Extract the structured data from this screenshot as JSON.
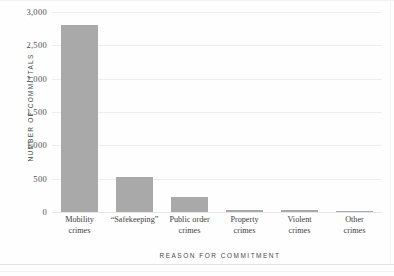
{
  "chart_data": {
    "type": "bar",
    "title": "",
    "subtitle": "",
    "xlabel": "REASON FOR COMMITMENT",
    "ylabel": "NUMBER OF COMMITTALS",
    "categories": [
      "Mobility\ncrimes",
      "“Safekeeping”",
      "Public order\ncrimes",
      "Property\ncrimes",
      "Violent\ncrimes",
      "Other\ncrimes"
    ],
    "values": [
      2800,
      530,
      230,
      30,
      35,
      20
    ],
    "ylim": [
      0,
      3000
    ],
    "ytick_values": [
      0,
      500,
      1000,
      1500,
      2000,
      2500,
      3000
    ],
    "ytick_labels": [
      "0",
      "500",
      "1,000",
      "1,500",
      "2,000",
      "2,500",
      "3,000"
    ],
    "grid": true,
    "legend": "none",
    "bar_color": "#a9a9a9",
    "grid_color": "#edeef0",
    "text_color": "#3d3d3d"
  }
}
